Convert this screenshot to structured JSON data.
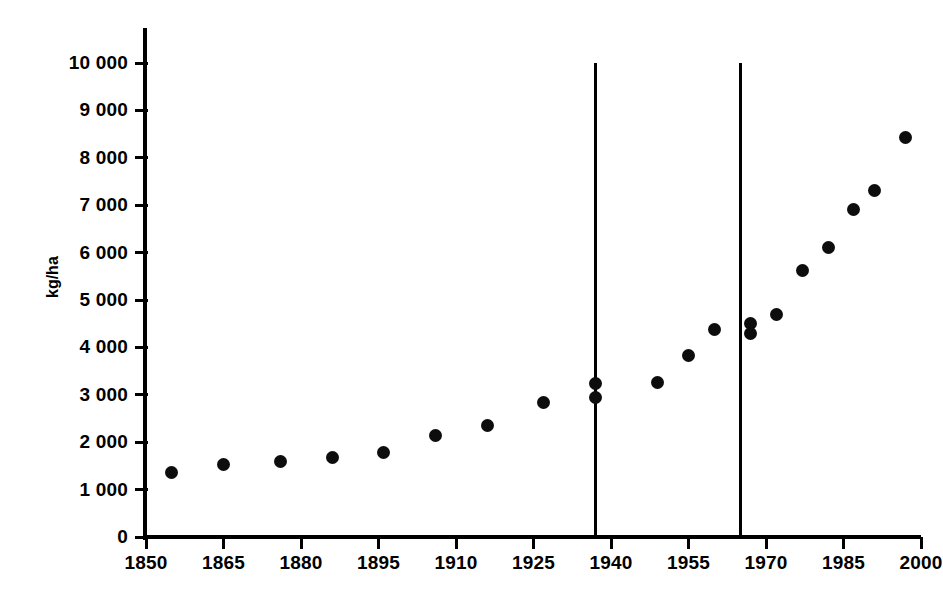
{
  "chart_data": {
    "type": "scatter",
    "title": "",
    "xlabel": "",
    "ylabel": "kg/ha",
    "xlim": [
      1850,
      2000
    ],
    "ylim": [
      0,
      10000
    ],
    "grid": false,
    "legend": null,
    "x_ticks": [
      "1850",
      "1865",
      "1880",
      "1895",
      "1910",
      "1925",
      "1940",
      "1955",
      "1970",
      "1985",
      "2000"
    ],
    "x_tick_values": [
      1850,
      1865,
      1880,
      1895,
      1910,
      1925,
      1940,
      1955,
      1970,
      1985,
      2000
    ],
    "y_ticks": [
      "0",
      "1 000",
      "2 000",
      "3 000",
      "4 000",
      "5 000",
      "6 000",
      "7 000",
      "8 000",
      "9 000",
      "10 000"
    ],
    "y_tick_values": [
      0,
      1000,
      2000,
      3000,
      4000,
      5000,
      6000,
      7000,
      8000,
      9000,
      10000
    ],
    "x": [
      1855,
      1865,
      1876,
      1886,
      1896,
      1906,
      1916,
      1927,
      1937,
      1937,
      1949,
      1955,
      1960,
      1967,
      1967,
      1972,
      1977,
      1982,
      1987,
      1991,
      1997
    ],
    "values": [
      1370,
      1520,
      1590,
      1670,
      1790,
      2140,
      2360,
      2840,
      3230,
      2940,
      3250,
      3830,
      4370,
      4510,
      4300,
      4690,
      5620,
      6100,
      6900,
      7320,
      8420
    ],
    "points": [
      {
        "x": 1855,
        "y": 1370
      },
      {
        "x": 1865,
        "y": 1520
      },
      {
        "x": 1876,
        "y": 1590
      },
      {
        "x": 1886,
        "y": 1670
      },
      {
        "x": 1896,
        "y": 1790
      },
      {
        "x": 1906,
        "y": 2140
      },
      {
        "x": 1916,
        "y": 2360
      },
      {
        "x": 1927,
        "y": 2840
      },
      {
        "x": 1937,
        "y": 3230
      },
      {
        "x": 1937,
        "y": 2940
      },
      {
        "x": 1949,
        "y": 3250
      },
      {
        "x": 1955,
        "y": 3830
      },
      {
        "x": 1960,
        "y": 4370
      },
      {
        "x": 1967,
        "y": 4510
      },
      {
        "x": 1967,
        "y": 4300
      },
      {
        "x": 1972,
        "y": 4690
      },
      {
        "x": 1977,
        "y": 5620
      },
      {
        "x": 1982,
        "y": 6100
      },
      {
        "x": 1987,
        "y": 6900
      },
      {
        "x": 1991,
        "y": 7320
      },
      {
        "x": 1997,
        "y": 8420
      }
    ],
    "annotations": [
      {
        "type": "vline",
        "x": 1937,
        "y_top": 10000,
        "y_bottom": 0
      },
      {
        "type": "vline",
        "x": 1965,
        "y_top": 10000,
        "y_bottom": 0
      }
    ],
    "marker_color": "#0d0d0d",
    "axis_color": "#000000"
  }
}
